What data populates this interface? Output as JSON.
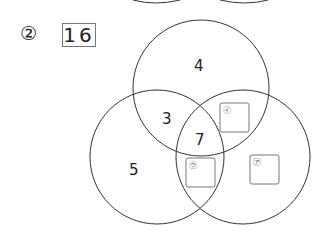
{
  "question": {
    "number_label": "②",
    "answer": "16"
  },
  "venn": {
    "regions": {
      "top_only": "4",
      "left_top": "3",
      "center": "7",
      "left_only": "5"
    },
    "blanks": [
      {
        "label": "㋑",
        "region": "top-right overlap"
      },
      {
        "label": "㋒",
        "region": "left-right overlap"
      },
      {
        "label": "㋐",
        "region": "right only"
      }
    ]
  }
}
